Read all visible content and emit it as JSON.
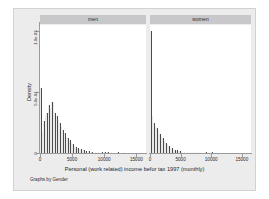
{
  "figure": {
    "xlabel": "Personal (work related) income befor tax 1997 (monthly)",
    "ylabel": "Density",
    "note": "Graphs by Gender",
    "background_color": "#ececed",
    "panel_header_color": "#c8c8ca",
    "bar_color": "#4c4c4e",
    "plot_background": "#ffffff"
  },
  "panels": [
    {
      "key": "men",
      "label": "men"
    },
    {
      "key": "women",
      "label": "women"
    }
  ],
  "axes": {
    "y_ticks": [
      {
        "value": 0,
        "label": "0"
      },
      {
        "value": 0.0005,
        "label": "5.0e-04"
      },
      {
        "value": 0.001,
        "label": "1.0e-03"
      }
    ],
    "x_ticks": [
      {
        "value": 0,
        "label": "0"
      },
      {
        "value": 5000,
        "label": "5000"
      },
      {
        "value": 10000,
        "label": "10000"
      },
      {
        "value": 15000,
        "label": "15000"
      }
    ],
    "xlim": [
      0,
      16500
    ],
    "ylim": [
      0,
      0.00105
    ],
    "grid": false
  },
  "chart_data": {
    "type": "bar",
    "title": "",
    "subtitle": "",
    "xlabel": "Personal (work related) income befor tax 1997 (monthly)",
    "ylabel": "Density",
    "note": "Graphs by Gender",
    "xlim": [
      0,
      16500
    ],
    "ylim": [
      0,
      0.00105
    ],
    "grid": false,
    "legend_position": "none",
    "bin_width": 250,
    "panel_variable": "Gender",
    "panels": [
      {
        "name": "men",
        "bin_starts": [
          0,
          250,
          500,
          750,
          1000,
          1250,
          1500,
          1750,
          2000,
          2250,
          2500,
          2750,
          3000,
          3250,
          3500,
          3750,
          4000,
          4250,
          4500,
          4750,
          5000,
          5250,
          5500,
          5750,
          6000,
          6250,
          6500,
          6750,
          7000,
          7500,
          8000,
          8500,
          9000,
          9500,
          10000,
          10500,
          11000,
          12000,
          13000,
          14000
        ],
        "densities": [
          0.00053,
          0.00017,
          0.00026,
          0.0003,
          0.00033,
          0.00039,
          0.00036,
          0.00042,
          0.000415,
          0.00033,
          0.0003,
          0.00027,
          0.000245,
          0.000215,
          0.00019,
          0.000165,
          0.000135,
          0.00012,
          0.000105,
          8.5e-05,
          7e-05,
          6e-05,
          5e-05,
          4.2e-05,
          3.5e-05,
          3e-05,
          2.6e-05,
          2.2e-05,
          1.8e-05,
          1.4e-05,
          1.2e-05,
          1e-05,
          9e-06,
          8e-06,
          7e-06,
          6e-06,
          6e-06,
          5e-06,
          5e-06,
          4e-06
        ]
      },
      {
        "name": "women",
        "bin_starts": [
          0,
          250,
          500,
          750,
          1000,
          1250,
          1500,
          1750,
          2000,
          2250,
          2500,
          2750,
          3000,
          3250,
          3500,
          3750,
          4000,
          4250,
          4500,
          4750,
          5000,
          5500,
          6000,
          6500,
          7000,
          7500,
          8000,
          9000,
          10000,
          11000,
          12000,
          13000
        ],
        "densities": [
          0.001,
          0.0003,
          0.00025,
          0.000225,
          0.000205,
          0.000185,
          0.00016,
          0.00014,
          0.00012,
          0.0001,
          8.5e-05,
          7e-05,
          5.8e-05,
          4.8e-05,
          4e-05,
          3.3e-05,
          2.7e-05,
          2.2e-05,
          1.8e-05,
          1.5e-05,
          1.2e-05,
          1e-05,
          9e-06,
          8e-06,
          7e-06,
          6e-06,
          6e-06,
          5e-06,
          5e-06,
          4e-06,
          4e-06,
          4e-06
        ]
      }
    ]
  }
}
